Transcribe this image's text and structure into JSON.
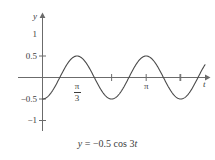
{
  "figure": {
    "caption": "y = −0.5 cos 3t",
    "caption_parts": {
      "lhs": "y",
      "equals": "=",
      "rhs": "−0.5 cos 3",
      "variable": "t"
    }
  },
  "axes": {
    "y_label": "y",
    "x_label": "t",
    "y_ticks": [
      {
        "value": 1,
        "label": "1"
      },
      {
        "value": 0.5,
        "label": "0.5"
      },
      {
        "value": -0.5,
        "label": "−0.5"
      },
      {
        "value": -1,
        "label": "−1"
      }
    ],
    "x_ticks": [
      {
        "value": 1.0472,
        "label": "π/3",
        "num": "π",
        "den": "3"
      },
      {
        "value": 3.1416,
        "label": "π"
      }
    ],
    "line_color": "#6b6b6b",
    "curve_color": "#4a4a4a"
  },
  "chart_data": {
    "type": "line",
    "title": "",
    "subtitle": "",
    "caption": "y = −0.5 cos 3t",
    "xlabel": "t",
    "ylabel": "y",
    "xlim": [
      -0.15,
      5.6
    ],
    "ylim": [
      -1.35,
      1.35
    ],
    "grid": false,
    "legend": null,
    "function": "y = -0.5 * cos(3t)",
    "amplitude": 0.5,
    "angular_frequency": 3,
    "period": 2.0944,
    "phase": "inverted cosine (starts at minimum)",
    "x_tick_values": [
      1.0472,
      2.0944,
      3.1416,
      4.18879,
      5.23599
    ],
    "x_tick_labels": [
      "π/3",
      "",
      "π",
      "",
      ""
    ],
    "y_tick_values": [
      1,
      0.5,
      -0.5,
      -1
    ],
    "y_tick_labels": [
      "1",
      "0.5",
      "−0.5",
      "−1"
    ],
    "key_points": [
      {
        "t": 0,
        "y": -0.5,
        "kind": "minimum"
      },
      {
        "t": 0.5236,
        "y": 0,
        "kind": "zero-crossing"
      },
      {
        "t": 1.0472,
        "y": 0.5,
        "kind": "maximum"
      },
      {
        "t": 1.5708,
        "y": 0,
        "kind": "zero-crossing"
      },
      {
        "t": 2.0944,
        "y": -0.5,
        "kind": "minimum"
      },
      {
        "t": 2.618,
        "y": 0,
        "kind": "zero-crossing"
      },
      {
        "t": 3.1416,
        "y": 0.5,
        "kind": "maximum"
      },
      {
        "t": 3.665,
        "y": 0,
        "kind": "zero-crossing"
      },
      {
        "t": 4.18879,
        "y": -0.5,
        "kind": "minimum"
      },
      {
        "t": 4.712,
        "y": 0,
        "kind": "zero-crossing"
      },
      {
        "t": 5.236,
        "y": 0.5,
        "kind": "maximum"
      }
    ],
    "series": [
      {
        "name": "y = -0.5 cos 3t",
        "x": [
          0,
          0.1745,
          0.349,
          0.5236,
          0.698,
          0.8727,
          1.0472,
          1.2217,
          1.3963,
          1.5708,
          1.7453,
          1.9199,
          2.0944,
          2.2689,
          2.4435,
          2.618,
          2.7925,
          2.9671,
          3.1416,
          3.3161,
          3.4907,
          3.6652,
          3.8397,
          4.0143,
          4.1888,
          4.3633,
          4.5379,
          4.7124,
          4.8869,
          5.0615,
          5.236,
          5.4105
        ],
        "y": [
          -0.5,
          -0.433,
          -0.25,
          0,
          0.25,
          0.433,
          0.5,
          0.433,
          0.25,
          0,
          -0.25,
          -0.433,
          -0.5,
          -0.433,
          -0.25,
          0,
          0.25,
          0.433,
          0.5,
          0.433,
          0.25,
          0,
          -0.25,
          -0.433,
          -0.5,
          -0.433,
          -0.25,
          0,
          0.25,
          0.433,
          0.5,
          0.433
        ]
      }
    ]
  }
}
